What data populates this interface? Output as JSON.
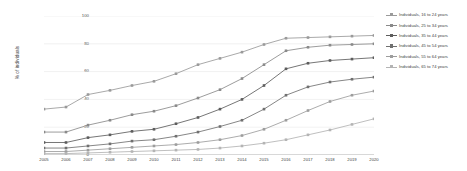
{
  "chart_data": {
    "type": "line",
    "title": "",
    "xlabel": "",
    "ylabel": "% of individuals",
    "ylim": [
      0,
      100
    ],
    "yticks": [
      0,
      20,
      40,
      60,
      80,
      100
    ],
    "grid": true,
    "legend_position": "right",
    "x": [
      2005,
      2006,
      2007,
      2008,
      2009,
      2010,
      2011,
      2012,
      2013,
      2014,
      2015,
      2016,
      2017,
      2018,
      2019,
      2020
    ],
    "categories": [
      "2005",
      "2006",
      "2007",
      "2008",
      "2009",
      "2010",
      "2011",
      "2012",
      "2013",
      "2014",
      "2015",
      "2016",
      "2017",
      "2018",
      "2019",
      "2020"
    ],
    "series": [
      {
        "name": "Individuals, 16 to 24 years",
        "color": "#9a9a9a",
        "values": [
          33,
          34.5,
          43.5,
          46.5,
          50,
          53,
          58.5,
          65,
          69.5,
          74,
          79.5,
          84,
          84.5,
          85,
          85.5,
          86
        ]
      },
      {
        "name": "Individuals, 25 to 34 years",
        "color": "#8a8a8a",
        "values": [
          16.5,
          16.5,
          21.5,
          25,
          29,
          31.5,
          35.5,
          41,
          47,
          55,
          65,
          75,
          77.5,
          79,
          79.5,
          80
        ]
      },
      {
        "name": "Individuals, 35 to 44 years",
        "color": "#5d5d5d",
        "values": [
          9,
          9,
          12.5,
          14.5,
          17,
          18.5,
          22.5,
          27,
          33,
          40,
          50,
          62,
          66,
          68,
          69,
          70
        ]
      },
      {
        "name": "Individuals, 45 to 54 years",
        "color": "#707070",
        "values": [
          5,
          5,
          6.5,
          8,
          10,
          11,
          13.5,
          16.5,
          20.5,
          25,
          33,
          43,
          49,
          52.5,
          54.5,
          56
        ]
      },
      {
        "name": "Individuals, 55 to 64 years",
        "color": "#9d9d9d",
        "values": [
          2.5,
          2.5,
          3.5,
          4.5,
          5.5,
          6.5,
          7.5,
          9,
          11,
          14,
          18.5,
          25,
          32,
          38.5,
          43,
          46
        ]
      },
      {
        "name": "Individuals, 65 to 74 years",
        "color": "#b4b4b4",
        "values": [
          1,
          1,
          1.5,
          2,
          2.5,
          3,
          3.5,
          4,
          5,
          6.5,
          8.5,
          11,
          14.5,
          18,
          22,
          26
        ]
      }
    ]
  },
  "legend": {
    "items": [
      "Individuals, 16 to 24 years",
      "Individuals, 25 to 34 years",
      "Individuals, 35 to 44 years",
      "Individuals, 45 to 54 years",
      "Individuals, 55 to 64 years",
      "Individuals, 65 to 74 years"
    ]
  }
}
